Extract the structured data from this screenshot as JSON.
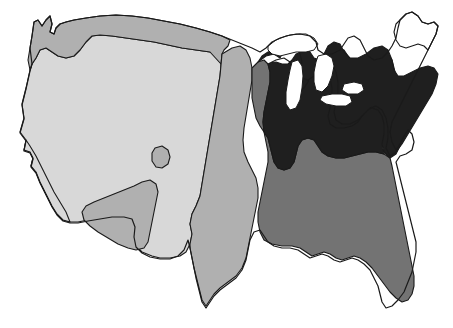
{
  "map": {
    "title": "Contiguous United States shaded map",
    "subject": "United States",
    "projection": "contiguous-48",
    "background_color": "#ffffff",
    "outline_color": "#1a1a1a",
    "width": 453,
    "height": 328,
    "shading_scheme": "four-level monochrome choropleth",
    "legend_shown": false,
    "labels_shown": false,
    "classes": [
      {
        "id": "class-lightest",
        "rank": 1,
        "label": "Lightest shade",
        "color": "#d8d8d8",
        "region_name": "West and Great Plains interior",
        "areas": "Pacific Coast, Great Basin, Northern Rockies interior, central High Plains"
      },
      {
        "id": "class-light-medium",
        "rank": 2,
        "label": "Light-medium shade",
        "color": "#b0b0b0",
        "region_name": "Northern border band, Southwest, Texas and Central Plains",
        "areas": "Washington-Montana northern tier, Arizona-New Mexico, Texas, Oklahoma, Kansas, Nebraska, Dakotas, small Colorado-Utah enclave"
      },
      {
        "id": "class-medium-dark",
        "rank": 3,
        "label": "Medium-dark shade",
        "color": "#737373",
        "region_name": "South and Southeast",
        "areas": "Louisiana, Mississippi, Alabama, Georgia, Florida, Carolinas coastal plain, Arkansas, Missouri bootheel"
      },
      {
        "id": "class-darkest",
        "rank": 4,
        "label": "Darkest shade",
        "color": "#1f1f1f",
        "region_name": "Great Lakes and Northeast",
        "areas": "Wisconsin, Michigan, Illinois, Indiana, Ohio, Kentucky, Tennessee, West Virginia, Virginia, Pennsylvania, New York, New England"
      }
    ],
    "unfilled_features": [
      {
        "id": "great-lakes",
        "label": "Great Lakes",
        "color": "#ffffff",
        "note": "Lakes drawn as white voids with outline"
      },
      {
        "id": "maine",
        "label": "Maine",
        "color": "#ffffff",
        "note": "Outlined but left unfilled"
      }
    ]
  }
}
